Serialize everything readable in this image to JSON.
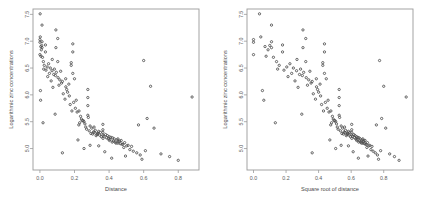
{
  "figure": {
    "background": "#ffffff",
    "point_color": "#4d4d4d",
    "frame_color": "#9a9a9a"
  },
  "chart_data": [
    {
      "type": "scatter",
      "panel": "left",
      "title": "",
      "xlabel": "Distance",
      "ylabel": "Logarithmic zinc concentrations",
      "xlim": [
        -0.04,
        0.92
      ],
      "ylim": [
        4.6,
        7.6
      ],
      "xticks": [
        0.0,
        0.2,
        0.4,
        0.6,
        0.8
      ],
      "xticklabels": [
        "0.0",
        "0.2",
        "0.4",
        "0.6",
        "0.8"
      ],
      "yticks": [
        5.0,
        5.5,
        6.0,
        6.5,
        7.0,
        7.5
      ],
      "yticklabels": [
        "5.0",
        "5.5",
        "6.0",
        "6.5",
        "7.0",
        "7.5"
      ],
      "grid": false,
      "legend": "none",
      "n_points": 155,
      "x": [
        0.00136,
        0.01222,
        0.10303,
        0.19009,
        0.27709,
        0.36407,
        0.19009,
        0.09234,
        0.18116,
        0.27709,
        0.36407,
        0.09234,
        0.18116,
        0.27709,
        0.36407,
        0.45105,
        0.0,
        0.01222,
        0.03182,
        0.10303,
        0.19009,
        0.27709,
        0.36407,
        0.45105,
        0.0,
        0.01222,
        0.03182,
        0.07132,
        0.14905,
        0.22609,
        0.31307,
        0.40005,
        0.0,
        0.0418,
        0.0836,
        0.1672,
        0.2508,
        0.3344,
        0.418,
        0.5016,
        0.02,
        0.06,
        0.12,
        0.2,
        0.28,
        0.34,
        0.42,
        0.48,
        0.005,
        0.05,
        0.095,
        0.15,
        0.23,
        0.3,
        0.38,
        0.46,
        0.015,
        0.07,
        0.13,
        0.21,
        0.29,
        0.35,
        0.43,
        0.52,
        0.008,
        0.08,
        0.155,
        0.24,
        0.32,
        0.39,
        0.47,
        0.56,
        0.025,
        0.105,
        0.17,
        0.26,
        0.335,
        0.41,
        0.49,
        0.58,
        0.002,
        0.115,
        0.195,
        0.255,
        0.31,
        0.37,
        0.445,
        0.54,
        0.035,
        0.09,
        0.16,
        0.225,
        0.305,
        0.365,
        0.455,
        0.6,
        0.006,
        0.125,
        0.205,
        0.27,
        0.345,
        0.405,
        0.465,
        0.62,
        0.045,
        0.135,
        0.215,
        0.285,
        0.355,
        0.425,
        0.51,
        0.66,
        0.01,
        0.145,
        0.235,
        0.295,
        0.33,
        0.435,
        0.53,
        0.7,
        0.055,
        0.11,
        0.245,
        0.315,
        0.385,
        0.44,
        0.57,
        0.75,
        0.004,
        0.065,
        0.175,
        0.265,
        0.395,
        0.475,
        0.59,
        0.8,
        0.022,
        0.075,
        0.185,
        0.325,
        0.402,
        0.485,
        0.61,
        0.88,
        0.003,
        0.088,
        0.22,
        0.29,
        0.375,
        0.495,
        0.64,
        0.018,
        0.13,
        0.255,
        0.34,
        0.415,
        0.505
      ],
      "y": [
        7.51,
        7.3,
        7.05,
        6.8,
        6.1,
        5.45,
        6.95,
        7.21,
        6.55,
        5.95,
        5.3,
        6.88,
        6.6,
        5.8,
        5.25,
        5.1,
        7.03,
        6.99,
        6.93,
        6.62,
        6.4,
        5.62,
        5.35,
        5.18,
        6.98,
        6.88,
        6.8,
        6.66,
        6.3,
        5.7,
        5.4,
        5.22,
        6.75,
        6.52,
        6.48,
        6.2,
        5.52,
        5.28,
        5.12,
        5.05,
        6.62,
        6.5,
        6.44,
        6.3,
        5.58,
        5.32,
        5.2,
        5.08,
        6.9,
        6.58,
        6.42,
        6.15,
        5.48,
        5.38,
        5.26,
        5.14,
        6.7,
        6.45,
        6.25,
        5.9,
        5.42,
        5.3,
        5.18,
        4.98,
        6.84,
        6.38,
        6.1,
        5.55,
        5.34,
        5.24,
        5.15,
        4.92,
        6.55,
        6.32,
        5.98,
        5.46,
        5.29,
        5.21,
        5.11,
        4.88,
        7.08,
        6.28,
        5.86,
        5.5,
        5.31,
        5.23,
        5.16,
        4.95,
        6.46,
        6.36,
        6.05,
        5.44,
        5.27,
        5.19,
        5.13,
        6.64,
        6.72,
        6.22,
        5.75,
        5.36,
        5.25,
        5.17,
        5.09,
        5.56,
        6.34,
        6.02,
        5.68,
        5.33,
        5.22,
        5.14,
        5.06,
        5.38,
        6.92,
        5.92,
        5.6,
        5.28,
        5.26,
        5.12,
        5.04,
        4.9,
        6.4,
        6.18,
        5.52,
        5.3,
        5.2,
        5.1,
        5.44,
        4.85,
        5.9,
        6.26,
        5.82,
        5.4,
        5.18,
        5.08,
        4.8,
        4.78,
        6.48,
        6.14,
        5.7,
        5.24,
        5.15,
        5.02,
        4.96,
        5.96,
        6.08,
        5.64,
        5.16,
        5.06,
        4.94,
        4.86,
        6.16,
        5.48,
        4.92,
        5.0,
        5.05,
        4.82
      ]
    },
    {
      "type": "scatter",
      "panel": "right",
      "title": "",
      "xlabel": "Square root of distance",
      "ylabel": "Logarithmic zinc concentrations",
      "xlim": [
        -0.04,
        0.98
      ],
      "ylim": [
        4.6,
        7.6
      ],
      "xticks": [
        0.0,
        0.2,
        0.4,
        0.6,
        0.8
      ],
      "xticklabels": [
        "0.0",
        "0.2",
        "0.4",
        "0.6",
        "0.8"
      ],
      "yticks": [
        5.0,
        5.5,
        6.0,
        6.5,
        7.0,
        7.5
      ],
      "yticklabels": [
        "5.0",
        "5.5",
        "6.0",
        "6.5",
        "7.0",
        "7.5"
      ],
      "grid": false,
      "legend": "none",
      "n_points": 155,
      "transform": "x_right = sqrt(x_left)"
    }
  ]
}
